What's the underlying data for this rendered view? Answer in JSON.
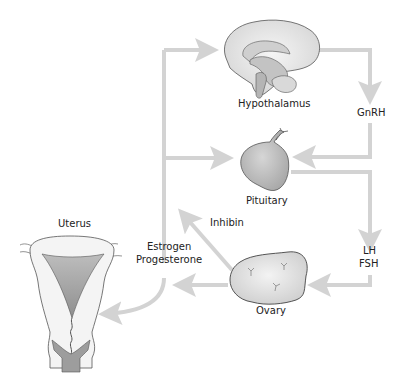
{
  "diagram": {
    "arrow_color": "#d3d3d3",
    "organs": {
      "hypothalamus": {
        "label": "Hypothalamus"
      },
      "pituitary": {
        "label": "Pituitary"
      },
      "ovary": {
        "label": "Ovary"
      },
      "uterus": {
        "label": "Uterus"
      }
    },
    "hormones": {
      "gnrh": "GnRH",
      "lh": "LH",
      "fsh": "FSH",
      "inhibin": "Inhibin",
      "estrogen": "Estrogen",
      "progesterone": "Progesterone"
    },
    "pathways": [
      {
        "from": "Hypothalamus",
        "to": "Pituitary",
        "via": "GnRH"
      },
      {
        "from": "Pituitary",
        "to": "Ovary",
        "via": "LH / FSH"
      },
      {
        "from": "Ovary",
        "to": "Pituitary",
        "via": "Inhibin"
      },
      {
        "from": "Ovary",
        "to": "Hypothalamus",
        "via": "Estrogen / Progesterone"
      },
      {
        "from": "Ovary",
        "to": "Pituitary",
        "via": "Estrogen / Progesterone"
      },
      {
        "from": "Ovary",
        "to": "Uterus",
        "via": "Estrogen / Progesterone"
      }
    ]
  }
}
